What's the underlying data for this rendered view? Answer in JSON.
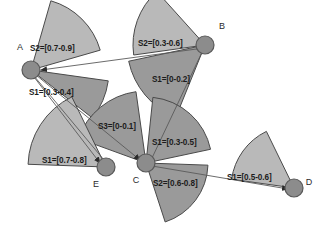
{
  "figure": {
    "background_color": "#ffffff",
    "wedge_fill_light": "#b9b9b9",
    "wedge_fill_dark": "#9a9a9a",
    "wedge_stroke": "#4a4a4a",
    "node_fill": "#8c8c8c",
    "node_stroke": "#595959",
    "edge_color": "#5a5a5a",
    "width": 327,
    "height": 228
  },
  "nodes": [
    {
      "id": "A",
      "label": "A",
      "cx": 31,
      "cy": 70,
      "r": 9,
      "label_x": 20,
      "label_y": 50
    },
    {
      "id": "B",
      "label": "B",
      "cx": 205,
      "cy": 45,
      "r": 9,
      "label_x": 222,
      "label_y": 29
    },
    {
      "id": "C",
      "label": "C",
      "cx": 146,
      "cy": 163,
      "r": 9,
      "label_x": 136,
      "label_y": 183
    },
    {
      "id": "D",
      "label": "D",
      "cx": 294,
      "cy": 188,
      "r": 9,
      "label_x": 309,
      "label_y": 185
    },
    {
      "id": "E",
      "label": "E",
      "cx": 106,
      "cy": 167,
      "r": 9,
      "label_x": 96,
      "label_y": 187
    }
  ],
  "sectors": [
    {
      "id": "A-S2",
      "owner": "A",
      "label": "S2=[0.7-0.9]",
      "shade": "light",
      "cx": 31,
      "cy": 70,
      "radius": 72,
      "start_angle": -74,
      "end_angle": -16,
      "label_x": 30,
      "label_y": 51
    },
    {
      "id": "A-S1",
      "owner": "A",
      "label": "S1=[0.3-0.4]",
      "shade": "dark",
      "cx": 31,
      "cy": 70,
      "radius": 78,
      "start_angle": 8,
      "end_angle": 38,
      "label_x": 29,
      "label_y": 95
    },
    {
      "id": "B-S2",
      "owner": "B",
      "label": "S2=[0.3-0.6]",
      "shade": "light",
      "cx": 205,
      "cy": 45,
      "radius": 72,
      "start_angle": 172,
      "end_angle": 228,
      "label_x": 138,
      "label_y": 46
    },
    {
      "id": "B-S1",
      "owner": "B",
      "label": "S1=[0-0.2]",
      "shade": "dark",
      "cx": 205,
      "cy": 45,
      "radius": 78,
      "start_angle": 112,
      "end_angle": 168,
      "label_x": 152,
      "label_y": 82
    },
    {
      "id": "C-S3",
      "owner": "C",
      "label": "S3=[0-0.1]",
      "shade": "dark",
      "cx": 146,
      "cy": 163,
      "radius": 72,
      "start_angle": 200,
      "end_angle": 262,
      "label_x": 98,
      "label_y": 129
    },
    {
      "id": "C-S1",
      "owner": "C",
      "label": "S1=[0.3-0.5]",
      "shade": "dark",
      "cx": 146,
      "cy": 163,
      "radius": 66,
      "start_angle": 276,
      "end_angle": 348,
      "label_x": 152,
      "label_y": 145
    },
    {
      "id": "C-S2",
      "owner": "C",
      "label": "S2=[0.6-0.8]",
      "shade": "dark",
      "cx": 146,
      "cy": 163,
      "radius": 62,
      "start_angle": 2,
      "end_angle": 72,
      "label_x": 153,
      "label_y": 186
    },
    {
      "id": "E-S1",
      "owner": "E",
      "label": "S1=[0.7-0.8]",
      "shade": "light",
      "cx": 106,
      "cy": 167,
      "radius": 78,
      "start_angle": 182,
      "end_angle": 244,
      "label_x": 42,
      "label_y": 163
    },
    {
      "id": "D-S1",
      "owner": "D",
      "label": "S1=[0.5-0.6]",
      "shade": "light",
      "cx": 294,
      "cy": 188,
      "radius": 63,
      "start_angle": 188,
      "end_angle": 244,
      "label_x": 227,
      "label_y": 180
    }
  ],
  "edges": [
    {
      "id": "B-to-A",
      "from": "B",
      "to": "A",
      "x1": 204,
      "y1": 48,
      "x2": 41,
      "y2": 70,
      "arrow": true
    },
    {
      "id": "B-to-C",
      "from": "B",
      "to": "C",
      "x1": 204,
      "y1": 48,
      "x2": 152,
      "y2": 158,
      "arrow": false
    },
    {
      "id": "A-to-E",
      "from": "A",
      "to": "E",
      "x1": 34,
      "y1": 77,
      "x2": 100,
      "y2": 163,
      "arrow": true
    },
    {
      "id": "E-to-A",
      "from": "E",
      "to": "A",
      "x1": 104,
      "y1": 160,
      "x2": 34,
      "y2": 76,
      "arrow": false
    },
    {
      "id": "A-to-C",
      "from": "A",
      "to": "C",
      "x1": 36,
      "y1": 75,
      "x2": 140,
      "y2": 160,
      "arrow": true
    },
    {
      "id": "C-to-D",
      "from": "C",
      "to": "D",
      "x1": 152,
      "y1": 166,
      "x2": 288,
      "y2": 189,
      "arrow": true
    }
  ]
}
